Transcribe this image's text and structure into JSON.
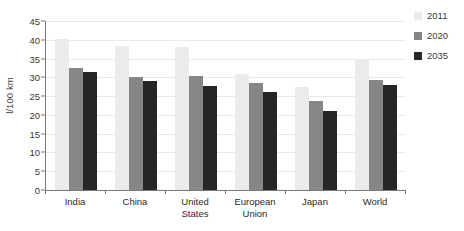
{
  "chart_data": {
    "type": "bar",
    "title": "",
    "xlabel": "",
    "ylabel": "l/100 km",
    "ylim": [
      0,
      45
    ],
    "yticks": [
      0,
      5,
      10,
      15,
      20,
      25,
      30,
      35,
      40,
      45
    ],
    "grid": true,
    "legend_position": "right",
    "categories": [
      "India",
      "China",
      "United States",
      "European Union",
      "Japan",
      "World"
    ],
    "category_lines": [
      [
        "India"
      ],
      [
        "China"
      ],
      [
        "United",
        "States"
      ],
      [
        "European",
        "Union"
      ],
      [
        "Japan"
      ],
      [
        "World"
      ]
    ],
    "series": [
      {
        "name": "2011",
        "color": "#ecebeb",
        "values": [
          40.3,
          38.3,
          38.1,
          30.8,
          27.3,
          35.0
        ]
      },
      {
        "name": "2020",
        "color": "#868686",
        "values": [
          32.5,
          30.2,
          30.4,
          28.5,
          23.7,
          29.3
        ]
      },
      {
        "name": "2035",
        "color": "#262626",
        "values": [
          31.3,
          29.0,
          27.7,
          26.0,
          21.0,
          28.0
        ]
      }
    ]
  },
  "legend": {
    "items": [
      {
        "label": "2011",
        "color": "#ecebeb"
      },
      {
        "label": "2020",
        "color": "#868686"
      },
      {
        "label": "2035",
        "color": "#262626"
      }
    ]
  }
}
